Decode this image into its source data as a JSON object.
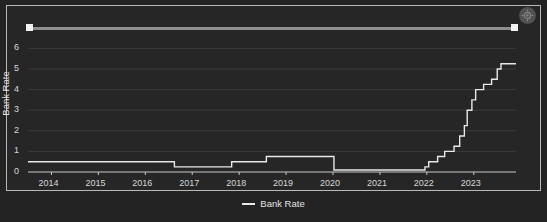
{
  "chart_data": {
    "type": "line",
    "title": "",
    "subtitle": "",
    "xlabel": "",
    "ylabel": "Bank Rate",
    "xlim": [
      2013.5,
      2023.9
    ],
    "ylim": [
      0,
      6.6
    ],
    "yticks": [
      0,
      1,
      2,
      3,
      4,
      5,
      6
    ],
    "xticks": [
      2014,
      2015,
      2016,
      2017,
      2018,
      2019,
      2020,
      2021,
      2022,
      2023
    ],
    "xtick_labels": [
      "2014",
      "2015",
      "2016",
      "2017",
      "2018",
      "2019",
      "2020",
      "2021",
      "2022",
      "2023"
    ],
    "ytick_labels": [
      "0",
      "1",
      "2",
      "3",
      "4",
      "5",
      "6"
    ],
    "grid": true,
    "grid_axis": "y",
    "legend_position": "bottom-center",
    "step_style": "post",
    "series": [
      {
        "name": "Bank Rate",
        "color": "#e8e8e8",
        "x": [
          2013.5,
          2016.62,
          2017.84,
          2018.58,
          2019.96,
          2020.02,
          2021.96,
          2022.04,
          2022.23,
          2022.38,
          2022.58,
          2022.7,
          2022.8,
          2022.86,
          2022.96,
          2023.04,
          2023.21,
          2023.38,
          2023.5,
          2023.58,
          2023.9
        ],
        "values": [
          0.5,
          0.25,
          0.5,
          0.75,
          0.75,
          0.1,
          0.25,
          0.5,
          0.75,
          1.0,
          1.25,
          1.75,
          2.25,
          3.0,
          3.5,
          4.0,
          4.25,
          4.5,
          5.0,
          5.25,
          5.25
        ]
      }
    ],
    "annotations": []
  },
  "legend": {
    "entries": [
      {
        "label": "Bank Rate",
        "color": "#e8e8e8"
      }
    ]
  },
  "controls": {
    "range_slider": {
      "name": "time-range-slider",
      "left_handle_position_pct": 0,
      "right_handle_position_pct": 99
    },
    "settings_badge_icon": "gear-icon"
  },
  "colors": {
    "background": "#262626",
    "frame_border": "#b9b9b9",
    "series_line": "#e8e8e8",
    "gridline": "#3c3c3c",
    "axis": "#c9c9c9",
    "tick_text": "#d8d8d8"
  }
}
